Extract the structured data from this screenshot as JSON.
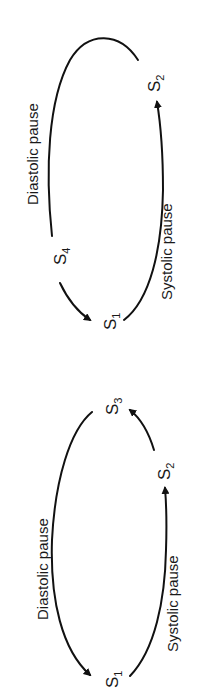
{
  "diagrams": [
    {
      "id": "top",
      "labels": {
        "diastolic": "Diastolic pause",
        "systolic": "Systolic pause"
      },
      "sounds": {
        "s1": {
          "base": "S",
          "sub": "1"
        },
        "s2": {
          "base": "S",
          "sub": "2"
        },
        "s4": {
          "base": "S",
          "sub": "4"
        }
      },
      "sequence": [
        "S4",
        "S1",
        "S2"
      ]
    },
    {
      "id": "bottom",
      "labels": {
        "diastolic": "Diastolic pause",
        "systolic": "Systolic pause"
      },
      "sounds": {
        "s1": {
          "base": "S",
          "sub": "1"
        },
        "s2": {
          "base": "S",
          "sub": "2"
        },
        "s3": {
          "base": "S",
          "sub": "3"
        }
      },
      "sequence": [
        "S1",
        "S2",
        "S3"
      ]
    }
  ],
  "colors": {
    "stroke": "#111111",
    "text": "#1a1a1a",
    "background": "#ffffff"
  }
}
